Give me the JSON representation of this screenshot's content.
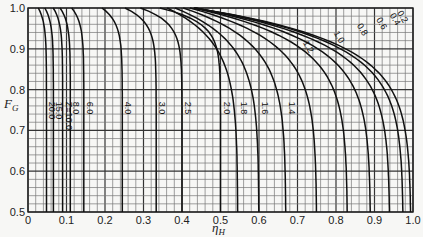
{
  "chart_data": {
    "type": "line",
    "title": "",
    "xlabel": "η_H",
    "ylabel": "F_G",
    "xlim": [
      0,
      1.0
    ],
    "ylim": [
      0.5,
      1.0
    ],
    "grid": true,
    "legend": "inline curve labels",
    "x_ticks": [
      "0",
      "0.1",
      "0.2",
      "0.3",
      "0.4",
      "0.5",
      "0.6",
      "0.7",
      "0.8",
      "0.9",
      "1.0"
    ],
    "y_ticks": [
      "0.5",
      "0.6",
      "0.7",
      "0.8",
      "0.9",
      "1.0"
    ],
    "parameter_name": "Z",
    "series": [
      {
        "name": "20.0",
        "asymptote_x": 0.048,
        "label": "20.0"
      },
      {
        "name": "15.0",
        "asymptote_x": 0.066,
        "label": "15.0"
      },
      {
        "name": "10.0",
        "asymptote_x": 0.09,
        "label": "Z=10.0"
      },
      {
        "name": "8.0",
        "asymptote_x": 0.11,
        "label": "8.0"
      },
      {
        "name": "6.0",
        "asymptote_x": 0.145,
        "label": "6.0"
      },
      {
        "name": "4.0",
        "asymptote_x": 0.245,
        "label": "4.0"
      },
      {
        "name": "3.0",
        "asymptote_x": 0.333,
        "label": "3.0"
      },
      {
        "name": "2.5",
        "asymptote_x": 0.4,
        "label": "2.5"
      },
      {
        "name": "2.0",
        "asymptote_x": 0.5,
        "label": "2.0"
      },
      {
        "name": "1.8",
        "asymptote_x": 0.545,
        "label": "1.8"
      },
      {
        "name": "1.6",
        "asymptote_x": 0.6,
        "label": "1.6"
      },
      {
        "name": "1.4",
        "asymptote_x": 0.67,
        "label": "1.4"
      },
      {
        "name": "1.2",
        "asymptote_x": 0.75,
        "label": "1.2"
      },
      {
        "name": "1.0",
        "asymptote_x": 0.83,
        "label": "1.0"
      },
      {
        "name": "0.8",
        "asymptote_x": 0.89,
        "label": "0.8"
      },
      {
        "name": "0.6",
        "asymptote_x": 0.94,
        "label": "0.6"
      },
      {
        "name": "0.4",
        "asymptote_x": 0.975,
        "label": "0.4"
      },
      {
        "name": "0.2",
        "asymptote_x": 0.995,
        "label": "0.2"
      }
    ]
  }
}
